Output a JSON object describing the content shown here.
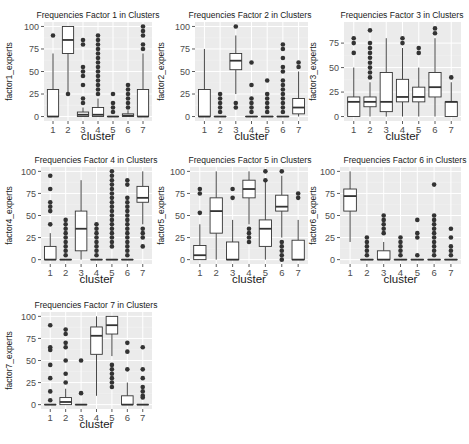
{
  "chart_data": [
    {
      "type": "boxplot",
      "title": "Frequencies Factor 1 in Clusters",
      "xlabel": "cluster",
      "ylabel": "factor1_experts",
      "categories": [
        "1",
        "2",
        "3",
        "4",
        "5",
        "6",
        "7"
      ],
      "ylim": [
        0,
        100
      ],
      "yticks": [
        0,
        25,
        50,
        75,
        100
      ],
      "grid": true,
      "boxes": [
        {
          "cluster": "1",
          "lower": 0,
          "q1": 0,
          "median": 0,
          "q3": 30,
          "upper": 70,
          "outliers": [
            90
          ]
        },
        {
          "cluster": "2",
          "lower": 25,
          "q1": 70,
          "median": 85,
          "q3": 100,
          "upper": 100,
          "outliers": [
            25
          ]
        },
        {
          "cluster": "3",
          "lower": 0,
          "q1": 0,
          "median": 2,
          "q3": 5,
          "upper": 10,
          "outliers": [
            15,
            20,
            35,
            45,
            50,
            55,
            80,
            85
          ]
        },
        {
          "cluster": "4",
          "lower": 0,
          "q1": 0,
          "median": 2,
          "q3": 10,
          "upper": 20,
          "outliers": [
            25,
            30,
            35,
            40,
            45,
            50,
            55,
            60,
            65,
            70,
            75,
            80,
            85,
            90
          ]
        },
        {
          "cluster": "5",
          "lower": 0,
          "q1": 0,
          "median": 0,
          "q3": 0,
          "upper": 0,
          "outliers": [
            5,
            10,
            15,
            25
          ]
        },
        {
          "cluster": "6",
          "lower": 0,
          "q1": 0,
          "median": 1,
          "q3": 3,
          "upper": 7,
          "outliers": [
            10,
            15,
            20,
            25,
            30,
            35
          ]
        },
        {
          "cluster": "7",
          "lower": 0,
          "q1": 0,
          "median": 0,
          "q3": 30,
          "upper": 70,
          "outliers": [
            75,
            80,
            90,
            95,
            100
          ]
        }
      ]
    },
    {
      "type": "boxplot",
      "title": "Frequencies Factor 2 in Clusters",
      "xlabel": "cluster",
      "ylabel": "factor2_experts",
      "categories": [
        "1",
        "2",
        "3",
        "4",
        "5",
        "6",
        "7"
      ],
      "ylim": [
        0,
        100
      ],
      "yticks": [
        0,
        25,
        50,
        75,
        100
      ],
      "grid": true,
      "boxes": [
        {
          "cluster": "1",
          "lower": 0,
          "q1": 0,
          "median": 0,
          "q3": 30,
          "upper": 75,
          "outliers": []
        },
        {
          "cluster": "2",
          "lower": 0,
          "q1": 0,
          "median": 0,
          "q3": 0,
          "upper": 0,
          "outliers": [
            5,
            10,
            15,
            20,
            25
          ]
        },
        {
          "cluster": "3",
          "lower": 25,
          "q1": 52,
          "median": 62,
          "q3": 70,
          "upper": 90,
          "outliers": [
            10,
            15,
            100
          ]
        },
        {
          "cluster": "4",
          "lower": 0,
          "q1": 0,
          "median": 0,
          "q3": 0,
          "upper": 0,
          "outliers": [
            5,
            10,
            15,
            20,
            35,
            60
          ]
        },
        {
          "cluster": "5",
          "lower": 0,
          "q1": 0,
          "median": 0,
          "q3": 0,
          "upper": 0,
          "outliers": [
            5,
            10,
            15,
            20,
            25,
            40
          ]
        },
        {
          "cluster": "6",
          "lower": 0,
          "q1": 0,
          "median": 0,
          "q3": 0,
          "upper": 0,
          "outliers": [
            5,
            10,
            15,
            20,
            25,
            30,
            35,
            40,
            50,
            55,
            65,
            75,
            80
          ]
        },
        {
          "cluster": "7",
          "lower": 0,
          "q1": 3,
          "median": 10,
          "q3": 20,
          "upper": 50,
          "outliers": [
            55,
            60
          ]
        }
      ]
    },
    {
      "type": "boxplot",
      "title": "Frequencies Factor 3 in Clusters",
      "xlabel": "cluster",
      "ylabel": "factor3_experts",
      "categories": [
        "1",
        "2",
        "3",
        "4",
        "5",
        "6",
        "7"
      ],
      "ylim": [
        0,
        92
      ],
      "yticks": [
        0,
        25,
        50,
        75
      ],
      "grid": true,
      "boxes": [
        {
          "cluster": "1",
          "lower": 0,
          "q1": 0,
          "median": 15,
          "q3": 20,
          "upper": 50,
          "outliers": [
            65,
            75,
            80
          ]
        },
        {
          "cluster": "2",
          "lower": 0,
          "q1": 10,
          "median": 15,
          "q3": 20,
          "upper": 35,
          "outliers": [
            40,
            45,
            50,
            55,
            60,
            65,
            70,
            75,
            88
          ]
        },
        {
          "cluster": "3",
          "lower": 0,
          "q1": 5,
          "median": 15,
          "q3": 45,
          "upper": 80,
          "outliers": []
        },
        {
          "cluster": "4",
          "lower": 0,
          "q1": 15,
          "median": 20,
          "q3": 38,
          "upper": 70,
          "outliers": [
            75,
            80
          ]
        },
        {
          "cluster": "5",
          "lower": 0,
          "q1": 15,
          "median": 20,
          "q3": 30,
          "upper": 50,
          "outliers": [
            65,
            70
          ]
        },
        {
          "cluster": "6",
          "lower": 0,
          "q1": 20,
          "median": 30,
          "q3": 45,
          "upper": 80,
          "outliers": [
            85,
            90
          ]
        },
        {
          "cluster": "7",
          "lower": 0,
          "q1": 0,
          "median": 15,
          "q3": 15,
          "upper": 35,
          "outliers": [
            40
          ]
        }
      ]
    },
    {
      "type": "boxplot",
      "title": "Frequencies Factor 4 in Clusters",
      "xlabel": "cluster",
      "ylabel": "factor4_experts",
      "categories": [
        "1",
        "2",
        "3",
        "4",
        "5",
        "6",
        "7"
      ],
      "ylim": [
        0,
        100
      ],
      "yticks": [
        0,
        25,
        50,
        75,
        100
      ],
      "grid": true,
      "boxes": [
        {
          "cluster": "1",
          "lower": 0,
          "q1": 0,
          "median": 0,
          "q3": 15,
          "upper": 30,
          "outliers": [
            40,
            55,
            60,
            65,
            80,
            95
          ]
        },
        {
          "cluster": "2",
          "lower": 0,
          "q1": 0,
          "median": 0,
          "q3": 0,
          "upper": 0,
          "outliers": [
            5,
            10,
            15,
            20,
            25,
            30,
            35,
            40,
            45
          ]
        },
        {
          "cluster": "3",
          "lower": 0,
          "q1": 10,
          "median": 35,
          "q3": 55,
          "upper": 90,
          "outliers": []
        },
        {
          "cluster": "4",
          "lower": 0,
          "q1": 0,
          "median": 0,
          "q3": 0,
          "upper": 0,
          "outliers": [
            5,
            10,
            15,
            20,
            25,
            30,
            35,
            40
          ]
        },
        {
          "cluster": "5",
          "lower": 0,
          "q1": 0,
          "median": 0,
          "q3": 0,
          "upper": 0,
          "outliers": [
            15,
            20,
            25,
            30,
            35,
            40,
            45,
            50,
            55,
            60,
            65,
            70,
            75,
            80,
            85,
            90,
            95,
            100
          ]
        },
        {
          "cluster": "6",
          "lower": 0,
          "q1": 0,
          "median": 0,
          "q3": 0,
          "upper": 0,
          "outliers": [
            5,
            10,
            15,
            20,
            25,
            30,
            35,
            40,
            45,
            50,
            55,
            60,
            65,
            70,
            85,
            90
          ]
        },
        {
          "cluster": "7",
          "lower": 40,
          "q1": 65,
          "median": 70,
          "q3": 83,
          "upper": 100,
          "outliers": [
            15,
            25,
            30,
            35
          ]
        }
      ]
    },
    {
      "type": "boxplot",
      "title": "Frequencies Factor 5 in Clusters",
      "xlabel": "cluster",
      "ylabel": "factor5_experts",
      "categories": [
        "1",
        "2",
        "3",
        "4",
        "5",
        "6",
        "7"
      ],
      "ylim": [
        0,
        100
      ],
      "yticks": [
        0,
        25,
        50,
        75,
        100
      ],
      "grid": true,
      "boxes": [
        {
          "cluster": "1",
          "lower": 0,
          "q1": 0,
          "median": 5,
          "q3": 16,
          "upper": 40,
          "outliers": [
            53,
            75,
            80
          ]
        },
        {
          "cluster": "2",
          "lower": 0,
          "q1": 30,
          "median": 55,
          "q3": 70,
          "upper": 100,
          "outliers": []
        },
        {
          "cluster": "3",
          "lower": 0,
          "q1": 0,
          "median": 0,
          "q3": 20,
          "upper": 45,
          "outliers": [
            70,
            80
          ]
        },
        {
          "cluster": "4",
          "lower": 40,
          "q1": 70,
          "median": 80,
          "q3": 90,
          "upper": 100,
          "outliers": [
            20,
            25,
            30,
            35
          ]
        },
        {
          "cluster": "5",
          "lower": 0,
          "q1": 15,
          "median": 35,
          "q3": 45,
          "upper": 90,
          "outliers": [
            90,
            100
          ]
        },
        {
          "cluster": "6",
          "lower": 25,
          "q1": 55,
          "median": 60,
          "q3": 73,
          "upper": 95,
          "outliers": [
            0,
            5,
            10,
            15,
            20,
            100
          ]
        },
        {
          "cluster": "7",
          "lower": 0,
          "q1": 0,
          "median": 0,
          "q3": 22,
          "upper": 45,
          "outliers": [
            70,
            75
          ]
        }
      ]
    },
    {
      "type": "boxplot",
      "title": "Frequencies Factor 6 in Clusters",
      "xlabel": "cluster",
      "ylabel": "factor6_experts",
      "categories": [
        "1",
        "2",
        "3",
        "4",
        "5",
        "6",
        "7"
      ],
      "ylim": [
        0,
        100
      ],
      "yticks": [
        0,
        25,
        50,
        75,
        100
      ],
      "grid": true,
      "boxes": [
        {
          "cluster": "1",
          "lower": 20,
          "q1": 55,
          "median": 72,
          "q3": 80,
          "upper": 100,
          "outliers": []
        },
        {
          "cluster": "2",
          "lower": 0,
          "q1": 0,
          "median": 0,
          "q3": 0,
          "upper": 0,
          "outliers": [
            5,
            10,
            15,
            20,
            25
          ]
        },
        {
          "cluster": "3",
          "lower": 0,
          "q1": 0,
          "median": 0,
          "q3": 10,
          "upper": 20,
          "outliers": [
            30,
            35,
            40,
            45,
            50
          ]
        },
        {
          "cluster": "4",
          "lower": 0,
          "q1": 0,
          "median": 0,
          "q3": 0,
          "upper": 0,
          "outliers": [
            5,
            10,
            15,
            20,
            25
          ]
        },
        {
          "cluster": "5",
          "lower": 0,
          "q1": 0,
          "median": 0,
          "q3": 0,
          "upper": 0,
          "outliers": [
            5,
            25,
            30,
            45
          ]
        },
        {
          "cluster": "6",
          "lower": 0,
          "q1": 0,
          "median": 0,
          "q3": 0,
          "upper": 0,
          "outliers": [
            5,
            10,
            15,
            20,
            25,
            30,
            35,
            40,
            45,
            50,
            85
          ]
        },
        {
          "cluster": "7",
          "lower": 0,
          "q1": 0,
          "median": 0,
          "q3": 0,
          "upper": 0,
          "outliers": [
            5,
            10,
            15,
            25,
            35
          ]
        }
      ]
    },
    {
      "type": "boxplot",
      "title": "Frequencies Factor 7 in Clusters",
      "xlabel": "cluster",
      "ylabel": "factor7_experts",
      "categories": [
        "1",
        "2",
        "3",
        "4",
        "5",
        "6",
        "7"
      ],
      "ylim": [
        0,
        100
      ],
      "yticks": [
        0,
        25,
        50,
        75,
        100
      ],
      "grid": true,
      "boxes": [
        {
          "cluster": "1",
          "lower": 0,
          "q1": 0,
          "median": 0,
          "q3": 0,
          "upper": 0,
          "outliers": [
            5,
            15,
            30,
            45,
            62,
            65,
            90
          ]
        },
        {
          "cluster": "2",
          "lower": 0,
          "q1": 0,
          "median": 3,
          "q3": 8,
          "upper": 18,
          "outliers": [
            25,
            35,
            50,
            65,
            70,
            80,
            85
          ]
        },
        {
          "cluster": "3",
          "lower": 0,
          "q1": 0,
          "median": 0,
          "q3": 0,
          "upper": 0,
          "outliers": [
            13,
            50
          ]
        },
        {
          "cluster": "4",
          "lower": 10,
          "q1": 57,
          "median": 78,
          "q3": 88,
          "upper": 100,
          "outliers": []
        },
        {
          "cluster": "5",
          "lower": 55,
          "q1": 80,
          "median": 90,
          "q3": 100,
          "upper": 100,
          "outliers": [
            20,
            25,
            30,
            35,
            40,
            45
          ]
        },
        {
          "cluster": "6",
          "lower": 0,
          "q1": 0,
          "median": 0,
          "q3": 10,
          "upper": 25,
          "outliers": [
            40,
            60,
            70
          ]
        },
        {
          "cluster": "7",
          "lower": 0,
          "q1": 0,
          "median": 0,
          "q3": 0,
          "upper": 0,
          "outliers": [
            8,
            10,
            15,
            20,
            30,
            40,
            65
          ]
        }
      ]
    }
  ],
  "colors": {
    "panel_bg": "#ebebeb",
    "grid_major": "#ffffff",
    "grid_minor": "#f2f2f2",
    "box_fill": "#ffffff",
    "box_stroke": "#333333",
    "outlier": "#333333",
    "tick_text": "#4d4d4d",
    "axis_title": "#1a1a1a"
  }
}
